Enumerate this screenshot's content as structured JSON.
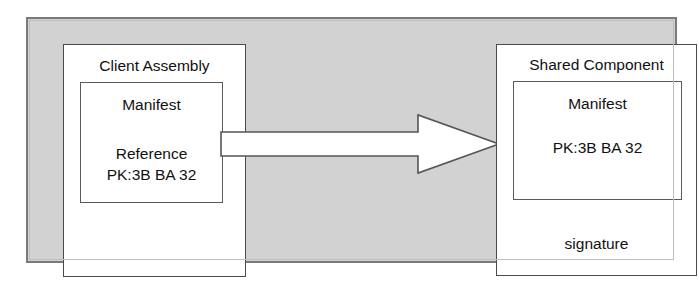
{
  "diagram": {
    "title_visible": false,
    "colors": {
      "container_fill": "#d2d2d2",
      "container_border": "#7a7a7a",
      "box_fill": "#ffffff",
      "box_border": "#4a4a4a",
      "text": "#111111",
      "arrow_fill": "#ffffff",
      "arrow_stroke": "#555555"
    },
    "client_assembly": {
      "title": "Client Assembly",
      "manifest": {
        "heading": "Manifest",
        "reference_label": "Reference",
        "reference_key": "PK:3B BA 32"
      }
    },
    "shared_component": {
      "title": "Shared Component",
      "manifest": {
        "heading": "Manifest",
        "public_key": "PK:3B BA 32"
      },
      "signature_label": "signature"
    },
    "arrow": {
      "name": "reference-arrow",
      "direction": "right",
      "from": "Client Assembly",
      "to": "Shared Component",
      "label": ""
    }
  }
}
